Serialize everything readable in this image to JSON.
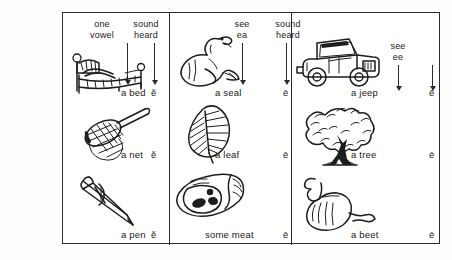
{
  "worksheet": {
    "title": "short and long e vowel sound chart"
  },
  "columns": [
    {
      "id": "short-e",
      "headers": {
        "spelling": "one\nvowel",
        "spelling_line1": "one",
        "spelling_line2": "vowel",
        "sound_line1": "sound",
        "sound_line2": "heard"
      },
      "rows": [
        {
          "picture": "bed-icon",
          "label": "a bed",
          "vowel": "ĕ"
        },
        {
          "picture": "net-icon",
          "label": "a net",
          "vowel": "ĕ"
        },
        {
          "picture": "pen-icon",
          "label": "a pen",
          "vowel": "ĕ"
        }
      ]
    },
    {
      "id": "long-e-ea",
      "headers": {
        "spelling_line1": "see",
        "spelling_line2": "ea",
        "sound_line1": "sound",
        "sound_line2": "heard"
      },
      "rows": [
        {
          "picture": "seal-icon",
          "label": "a seal",
          "vowel": "ē"
        },
        {
          "picture": "leaf-icon",
          "label": "a leaf",
          "vowel": "ē"
        },
        {
          "picture": "meat-icon",
          "label": "some meat",
          "vowel": "ē"
        }
      ]
    },
    {
      "id": "long-e-ee",
      "headers": {
        "spelling_line1": "see",
        "spelling_line2": "ee"
      },
      "rows": [
        {
          "picture": "jeep-icon",
          "label": "a jeep",
          "vowel": "ē"
        },
        {
          "picture": "tree-icon",
          "label": "a tree",
          "vowel": "ē"
        },
        {
          "picture": "beet-icon",
          "label": "a beet",
          "vowel": "ē"
        }
      ]
    }
  ],
  "colors": {
    "ink": "#1d1d1d",
    "frame": "#2b2b2b",
    "paper": "#ffffff"
  }
}
